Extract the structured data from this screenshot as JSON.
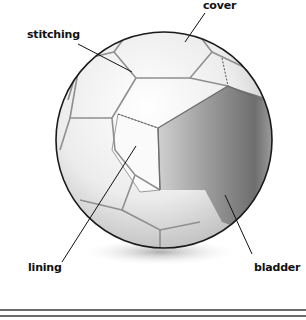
{
  "diagram": {
    "labels": [
      {
        "id": "cover",
        "text": "cover"
      },
      {
        "id": "stitching",
        "text": "stitching"
      },
      {
        "id": "lining",
        "text": "lining"
      },
      {
        "id": "bladder",
        "text": "bladder"
      }
    ],
    "colors": {
      "outline": "#1a1a1a",
      "panel_light": "#f4f4f4",
      "panel_shade": "#d8d8d8",
      "bladder_dark": "#7a7a7a",
      "bladder_light": "#c8c8c8",
      "shadow": "#bfbfbf",
      "rule": "#6a6a6a"
    }
  }
}
